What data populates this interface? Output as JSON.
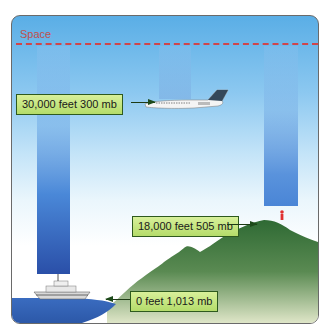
{
  "diagram": {
    "space_label": "Space",
    "labels": [
      {
        "altitude": "30,000 feet",
        "pressure": "300 mb",
        "text": "30,000 feet 300 mb",
        "points_to": "airplane"
      },
      {
        "altitude": "18,000 feet",
        "pressure": "505 mb",
        "text": "18,000 feet 505 mb",
        "points_to": "person-on-mountain"
      },
      {
        "altitude": "0 feet",
        "pressure": "1,013 mb",
        "text": "0 feet 1,013 mb",
        "points_to": "sea-level"
      }
    ],
    "objects": [
      "boat",
      "airplane",
      "mountain",
      "person",
      "water"
    ],
    "colors": {
      "sky_top": "#5aaee6",
      "space_line": "#d0454a",
      "label_fill": "#c6e682",
      "label_border": "#2e5a1e",
      "mountain": "#3e7a3a",
      "water": "#3a6cc0",
      "person": "#e03030"
    }
  }
}
